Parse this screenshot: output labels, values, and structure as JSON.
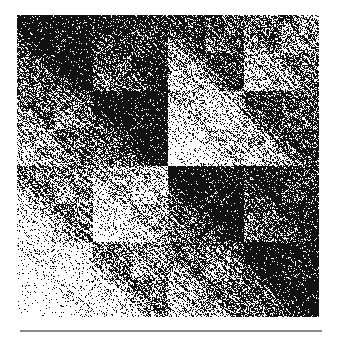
{
  "figure": {
    "size_px": 302,
    "recursion_levels": 5,
    "colors": {
      "ink": "#111111",
      "paper": "#ffffff",
      "rule": "#8a8a8a"
    }
  }
}
